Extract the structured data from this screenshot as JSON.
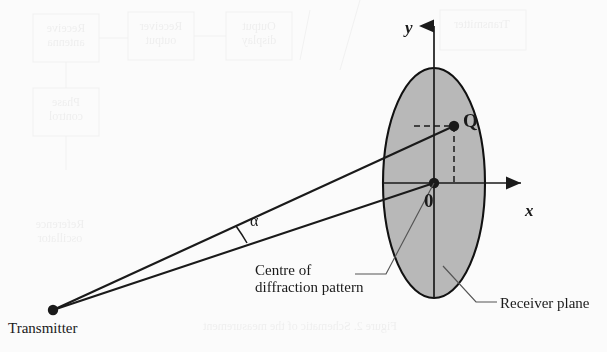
{
  "figure": {
    "background_color": "#fbfbfb",
    "ink_color": "#1a1a1a",
    "plane_fill_color": "#b8b8b8",
    "plane_stroke_color": "#111111"
  },
  "axes": {
    "y_label": "y",
    "x_label": "x",
    "origin_label": "0"
  },
  "points": {
    "q_label": "Q",
    "transmitter_label": "Transmitter"
  },
  "angles": {
    "alpha_label": "α"
  },
  "callouts": {
    "centre_line1": "Centre of",
    "centre_line2": "diffraction pattern",
    "receiver_plane": "Receiver plane"
  },
  "geometry": {
    "ellipse": {
      "cx": 434,
      "cy": 183,
      "rx": 51,
      "ry": 115
    },
    "origin": {
      "x": 434,
      "y": 183
    },
    "q_point": {
      "x": 454,
      "y": 126
    },
    "transmitter": {
      "x": 53,
      "y": 310
    },
    "y_axis": {
      "x": 434,
      "y_top": 12,
      "y_bottom": 298
    },
    "x_axis": {
      "y": 183,
      "x_left": 383,
      "x_right": 535
    }
  }
}
